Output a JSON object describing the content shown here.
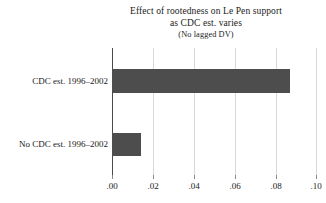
{
  "chart_data": {
    "type": "bar",
    "orientation": "horizontal",
    "title": "Effect of rootedness on Le Pen support",
    "subtitle": "as CDC est. varies",
    "note": "(No lagged DV)",
    "categories": [
      "CDC est. 1996–2002",
      "No CDC est. 1996–2002"
    ],
    "values": [
      0.087,
      0.014
    ],
    "xlabel": "",
    "ylabel": "",
    "xlim": [
      0.0,
      0.1
    ],
    "xticks": [
      0.0,
      0.02,
      0.04,
      0.06,
      0.08,
      0.1
    ],
    "xticklabels": [
      ".00",
      ".02",
      ".04",
      ".06",
      ".08",
      ".10"
    ],
    "grid": true,
    "legend": false,
    "bar_color": "#4d4d4d",
    "gridline_color": "#d8d8d8",
    "axis_color": "#4a4a4a",
    "background": "#ffffff"
  }
}
